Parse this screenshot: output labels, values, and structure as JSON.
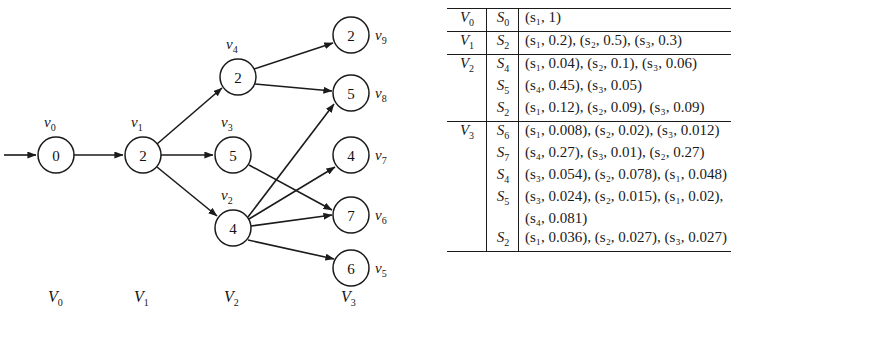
{
  "figure": {
    "graph": {
      "column_labels": [
        {
          "text": "V₀",
          "base": "V",
          "sub": "0",
          "x": 48,
          "y": 290
        },
        {
          "text": "V₁",
          "base": "V",
          "sub": "1",
          "x": 134,
          "y": 290
        },
        {
          "text": "V₂",
          "base": "V",
          "sub": "2",
          "x": 224,
          "y": 290
        },
        {
          "text": "V₃",
          "base": "V",
          "sub": "3",
          "x": 341,
          "y": 290
        }
      ],
      "nodes": [
        {
          "id": "v0",
          "label_base": "v",
          "label_sub": "0",
          "value": "0",
          "cx": 56,
          "cy": 155,
          "r": 18,
          "label_x": 44,
          "label_y": 122
        },
        {
          "id": "v1",
          "label_base": "v",
          "label_sub": "1",
          "value": "2",
          "cx": 143,
          "cy": 155,
          "r": 18,
          "label_x": 131,
          "label_y": 122
        },
        {
          "id": "v4",
          "label_base": "v",
          "label_sub": "4",
          "value": "2",
          "cx": 238,
          "cy": 77,
          "r": 18,
          "label_x": 226,
          "label_y": 44
        },
        {
          "id": "v3",
          "label_base": "v",
          "label_sub": "3",
          "value": "5",
          "cx": 233,
          "cy": 155,
          "r": 18,
          "label_x": 221,
          "label_y": 122
        },
        {
          "id": "v2",
          "label_base": "v",
          "label_sub": "2",
          "value": "4",
          "cx": 233,
          "cy": 228,
          "r": 18,
          "label_x": 221,
          "label_y": 195
        },
        {
          "id": "v9",
          "label_base": "v",
          "label_sub": "9",
          "value": "2",
          "cx": 351,
          "cy": 35,
          "r": 18,
          "label_x": 375,
          "label_y": 29
        },
        {
          "id": "v8",
          "label_base": "v",
          "label_sub": "8",
          "value": "5",
          "cx": 351,
          "cy": 93,
          "r": 18,
          "label_x": 375,
          "label_y": 87
        },
        {
          "id": "v7",
          "label_base": "v",
          "label_sub": "7",
          "value": "4",
          "cx": 351,
          "cy": 155,
          "r": 18,
          "label_x": 375,
          "label_y": 149
        },
        {
          "id": "v6",
          "label_base": "v",
          "label_sub": "6",
          "value": "7",
          "cx": 351,
          "cy": 215,
          "r": 18,
          "label_x": 375,
          "label_y": 209
        },
        {
          "id": "v5",
          "label_base": "v",
          "label_sub": "5",
          "value": "6",
          "cx": 351,
          "cy": 268,
          "r": 18,
          "label_x": 375,
          "label_y": 262
        }
      ],
      "edges": [
        {
          "from": "start",
          "to": "v0"
        },
        {
          "from": "v0",
          "to": "v1"
        },
        {
          "from": "v1",
          "to": "v4"
        },
        {
          "from": "v1",
          "to": "v3"
        },
        {
          "from": "v1",
          "to": "v2"
        },
        {
          "from": "v4",
          "to": "v9"
        },
        {
          "from": "v4",
          "to": "v8"
        },
        {
          "from": "v3",
          "to": "v6"
        },
        {
          "from": "v2",
          "to": "v8"
        },
        {
          "from": "v2",
          "to": "v7"
        },
        {
          "from": "v2",
          "to": "v6"
        },
        {
          "from": "v2",
          "to": "v5"
        }
      ]
    },
    "table": {
      "rows": [
        {
          "level": "V₀",
          "level_base": "V",
          "level_sub": "0",
          "state_base": "S",
          "state_sub": "0",
          "distribution": "(s₁, 1)",
          "rule_top": true
        },
        {
          "level": "V₁",
          "level_base": "V",
          "level_sub": "1",
          "state_base": "S",
          "state_sub": "2",
          "distribution": "(s₁, 0.2), (s₂, 0.5), (s₃, 0.3)",
          "rule_top": true
        },
        {
          "level": "V₂",
          "level_base": "V",
          "level_sub": "2",
          "state_base": "S",
          "state_sub": "4",
          "distribution": "(s₁, 0.04), (s₂, 0.1), (s₃, 0.06)",
          "rule_top": true
        },
        {
          "level": "",
          "level_base": "",
          "level_sub": "",
          "state_base": "S",
          "state_sub": "5",
          "distribution": "(s₄, 0.45), (s₃, 0.05)",
          "rule_top": false
        },
        {
          "level": "",
          "level_base": "",
          "level_sub": "",
          "state_base": "S",
          "state_sub": "2",
          "distribution": "(s₁, 0.12), (s₂, 0.09), (s₃, 0.09)",
          "rule_top": false
        },
        {
          "level": "V₃",
          "level_base": "V",
          "level_sub": "3",
          "state_base": "S",
          "state_sub": "6",
          "distribution": "(s₁, 0.008), (s₂, 0.02), (s₃, 0.012)",
          "rule_top": true
        },
        {
          "level": "",
          "level_base": "",
          "level_sub": "",
          "state_base": "S",
          "state_sub": "7",
          "distribution": "(s₄, 0.27), (s₃, 0.01), (s₂, 0.27)",
          "rule_top": false
        },
        {
          "level": "",
          "level_base": "",
          "level_sub": "",
          "state_base": "S",
          "state_sub": "4",
          "distribution": "(s₃, 0.054), (s₂, 0.078), (s₁, 0.048)",
          "rule_top": false
        },
        {
          "level": "",
          "level_base": "",
          "level_sub": "",
          "state_base": "S",
          "state_sub": "5",
          "distribution": "(s₃, 0.024), (s₂, 0.015), (s₁, 0.02),",
          "rule_top": false
        },
        {
          "level": "",
          "level_base": "",
          "level_sub": "",
          "state_base": "",
          "state_sub": "",
          "distribution": "(s₄, 0.081)",
          "rule_top": false
        },
        {
          "level": "",
          "level_base": "",
          "level_sub": "",
          "state_base": "S",
          "state_sub": "2",
          "distribution": "(s₁, 0.036), (s₂, 0.027), (s₃, 0.027)",
          "rule_top": false,
          "rule_bottom": true
        }
      ]
    }
  }
}
